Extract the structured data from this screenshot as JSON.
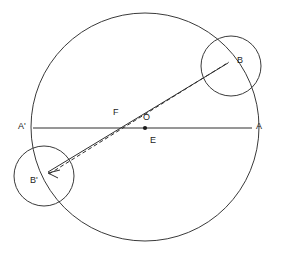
{
  "diagram": {
    "background_color": "#ffffff",
    "stroke_color": "#3a3a3a",
    "label_color": "#1c1c1c",
    "width": 281,
    "height": 257,
    "main_circle": {
      "name": "main-circle",
      "cx": 145,
      "cy": 127,
      "r": 114
    },
    "small_circle_b": {
      "name": "small-circle-b",
      "cx": 231,
      "cy": 66,
      "r": 30
    },
    "small_circle_bprime": {
      "name": "small-circle-b-prime",
      "cx": 44,
      "cy": 176,
      "r": 30
    },
    "diameter_line": {
      "name": "diameter-a-prime-to-a",
      "x1": 33,
      "y1": 128,
      "x2": 252,
      "y2": 128
    },
    "solid_chord": {
      "name": "solid-chord-b-prime-to-b",
      "x1": 48,
      "y1": 173,
      "x2": 228,
      "y2": 62
    },
    "dashed_chord": {
      "name": "dashed-chord-b-prime-to-b",
      "x1": 48,
      "y1": 173,
      "x2": 228,
      "y2": 62
    },
    "center_dot": {
      "name": "center-point-o",
      "cx": 145,
      "cy": 128,
      "r": 2
    },
    "points": [
      {
        "id": "A-prime",
        "label": "A'",
        "x": 21,
        "y": 127
      },
      {
        "id": "A",
        "label": "A",
        "x": 258,
        "y": 127
      },
      {
        "id": "B",
        "label": "B",
        "x": 239,
        "y": 61
      },
      {
        "id": "B-prime",
        "label": "B'",
        "x": 33,
        "y": 180
      },
      {
        "id": "F",
        "label": "F",
        "x": 114,
        "y": 113
      },
      {
        "id": "O",
        "label": "O",
        "x": 145,
        "y": 118
      },
      {
        "id": "E",
        "label": "E",
        "x": 153,
        "y": 141
      }
    ]
  }
}
